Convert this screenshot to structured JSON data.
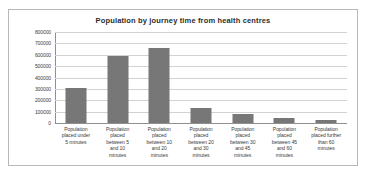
{
  "chart_data": {
    "type": "bar",
    "title": "Population by journey time from health centres",
    "xlabel": "",
    "ylabel": "",
    "ylim": [
      0,
      800000
    ],
    "ytick_step": 100000,
    "ytick_labels": [
      "800000",
      "700000",
      "600000",
      "500000",
      "400000",
      "300000",
      "200000",
      "100000",
      "0"
    ],
    "yticks": [
      800000,
      700000,
      600000,
      500000,
      400000,
      300000,
      200000,
      100000,
      0
    ],
    "grid": true,
    "legend": false,
    "bar_color": "#777777",
    "gridline_color": "#d2d2d2",
    "axis_color": "#8f8f8f",
    "border_color": "#b8b8b8",
    "categories": [
      "Population placed under 5 minutes",
      "Population placed between 5 and 10 minutes",
      "Population placed between 10 and 20 minutes",
      "Population placed between 20 and 30 minutes",
      "Population placed between 30 and 45 minutes",
      "Population placed between 45 and 60 minutes",
      "Population placed further than 60 minutes"
    ],
    "category_lines": [
      [
        "Population",
        "placed under",
        "5 minutes"
      ],
      [
        "Population",
        "placed",
        "between 5",
        "and 10",
        "minutes"
      ],
      [
        "Population",
        "placed",
        "between 10",
        "and 20",
        "minutes"
      ],
      [
        "Population",
        "placed",
        "between 20",
        "and 30",
        "minutes"
      ],
      [
        "Population",
        "placed",
        "between 30",
        "and 45",
        "minutes"
      ],
      [
        "Population",
        "placed",
        "between 45",
        "and 60",
        "minutes"
      ],
      [
        "Population",
        "placed further",
        "than 60",
        "minutes"
      ]
    ],
    "values": [
      308000,
      588000,
      662000,
      131000,
      80000,
      45000,
      30000
    ]
  }
}
